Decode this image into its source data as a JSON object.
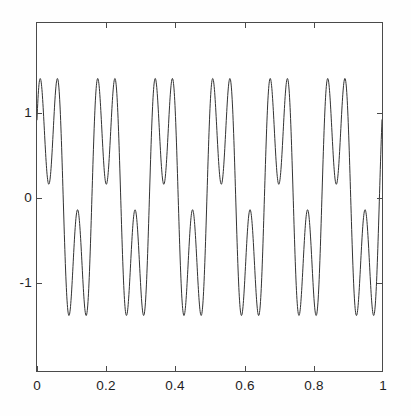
{
  "chart_data": {
    "type": "line",
    "title": "",
    "subtitle": "",
    "xlabel": "",
    "ylabel": "",
    "xlim": [
      0,
      1
    ],
    "ylim": [
      -2.05,
      2.05
    ],
    "grid": false,
    "legend": null,
    "x_ticks": [
      "0",
      "0.2",
      "0.4",
      "0.6",
      "0.8",
      "1"
    ],
    "x_tick_values": [
      0,
      0.2,
      0.4,
      0.6,
      0.8,
      1
    ],
    "y_ticks": [
      "1",
      "0",
      "-1"
    ],
    "y_tick_values": [
      1,
      0,
      -1
    ],
    "line_color": "#333333",
    "line_width": 1.0,
    "series": [
      {
        "name": "signal",
        "formula": "1.0*sin(2*pi*6*x + 0.28) + 0.85*sin(2*pi*18*x + 0.84)",
        "fundamental_frequency_hz": 6,
        "harmonic_frequency_hz": 18,
        "amplitude_max": 1.85,
        "amplitude_min": -1.85,
        "value_at_x0": 0.5,
        "value_at_x1": -0.6,
        "n_points": 1400
      }
    ]
  }
}
